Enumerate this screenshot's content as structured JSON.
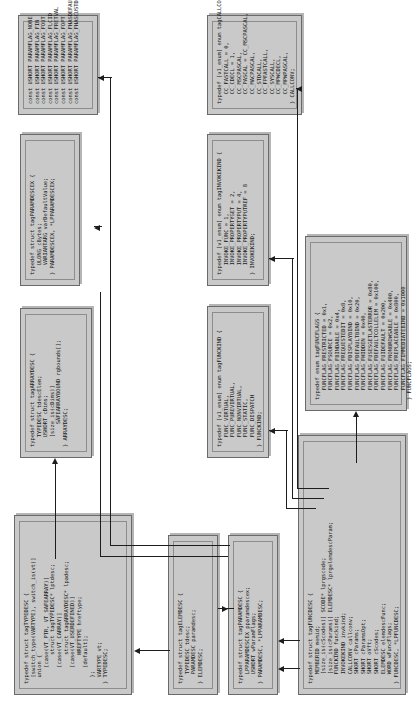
{
  "diagram": {
    "box_fill": "#c9c9c9",
    "box_border": "#6a6a6a",
    "line_color": "#1d1d1d"
  },
  "boxes": {
    "typedesc": {
      "name": "TYPEDESC",
      "code": "typedef struct tagTYPEDESC {\n  [switch_type(VARTYPE), switch_is(vt)]\n  union {\n     [case(VT_PTR, VT_SAFEARRAY)]\n         struct tagTYPEDESC* lptdesc;\n     [case(VT_CARRAY)]\n         struct tagARRAYDESC* lpadesc;\n     [case(VT_USERDEFINED)]\n         HREFTYPE hreftype;\n     [default];\n  };\n  VARTYPE vt;\n} TYPEDESC;"
    },
    "arraydesc": {
      "name": "ARRAYDESC",
      "code": "typedef struct tagARRAYDESC {\n   TYPEDESC tdescElem;\n   USHORT cDims;\n   [size_is(cDims)]\n       SAFEARRAYBOUND rgbounds[];\n} ARRAYDESC;"
    },
    "paramdescex": {
      "name": "PARAMDESCEX",
      "code": "typedef struct tagPARAMDESCEX {\n   ULONG cBytes;\n   VARIANTARG varDefaultValue;\n} PARAMDESCEX, *LPPARAMDESCEX;"
    },
    "paramflags": {
      "name": "PARAMFLAG constants",
      "code": "const USHORT PARAMFLAG_NONE          = 0x00;\nconst USHORT PARAMFLAG_FIN           = 0x01;\nconst USHORT PARAMFLAG_FOUT          = 0x02;\nconst USHORT PARAMFLAG_FLCID         = 0x04;\nconst USHORT PARAMFLAG_FRETVAL       = 0x08;\nconst USHORT PARAMFLAG_FOPT          = 0x10;\nconst USHORT PARAMFLAG_FHASDEFAULT   = 0x20;\nconst USHORT PARAMFLAG_FHASCUSTDATA  = 0x40;"
    },
    "elemdesc": {
      "name": "ELEMDESC",
      "code": "typedef struct tagELEMDESC {\n   TYPEDESC tdesc;\n   PARAMDESC paramdesc;\n} ELEMDESC;"
    },
    "paramdesc": {
      "name": "PARAMDESC",
      "code": "typedef struct tagPARAMDESC {\n   LPPARAMDESCEX pparamdescex;\n   USHORT wParamFlags;\n} PARAMDESC, *LPPARAMDESC;"
    },
    "funckind": {
      "name": "FUNCKIND",
      "code": "typedef [v1_enum] enum tagFUNCKIND {\n   FUNC_VIRTUAL,\n   FUNC_PUREVIRTUAL,\n   FUNC_NONVIRTUAL,\n   FUNC_STATIC,\n   FUNC_DISPATCH\n} FUNCKIND;"
    },
    "invokekind": {
      "name": "INVOKEKIND",
      "code": "typedef [v1_enum] enum tagINVOKEKIND {\n   INVOKE_FUNC = 1,\n   INVOKE_PROPERTYGET = 2,\n   INVOKE_PROPERTYPUT = 4,\n   INVOKE_PROPERTYPUTREF = 8\n} INVOKEKIND;"
    },
    "callconv": {
      "name": "CALLCONV",
      "code": "typedef [v1_enum] enum tagCALLCONV {\n   CC_FASTCALL = 0,\n   CC_CDECL = 1,\n   CC_MSCPASCAL,\n   CC_PASCAL = CC_MSCPASCAL,\n   CC_MACPASCAL,\n   CC_STDCALL,\n   CC_FPFASTCALL,\n   CC_SYSCALL,\n   CC_MPWCDECL,\n   CC_MPWPASCAL,\n} CALLCONV;"
    },
    "funcdesc": {
      "name": "FUNCDESC",
      "code": "typedef struct tagFUNCDESC {\n   MEMBERID memid;\n   [size_is(cScodes)] SCODE* lprgscode;\n   [size_is(cParams)] ELEMDESC* lprgelemdescParam;\n   FUNCKIND funckind;\n   INVOKEKIND invkind;\n   CALLCONV callconv;\n   SHORT cParams;\n   SHORT cParamsOpt;\n   SHORT oVft;\n   SHORT cScodes;\n   ELEMDESC elemdescFunc;\n   WORD wFuncFlags;\n} FUNCDESC, *LPFUNCDESC;"
    },
    "funcflags": {
      "name": "FUNCFLAGS",
      "code": "typedef enum tagFUNCFLAGS {\n   FUNCFLAG_FRESTRICTED = 0x1,\n   FUNCFLAG_FSOURCE = 0x2,\n   FUNCFLAG_FBINDABLE = 0x4,\n   FUNCFLAG_FREQUESTEDIT = 0x8,\n   FUNCFLAG_FDISPLAYBIND = 0x10,\n   FUNCFLAG_FDEFAULTBIND = 0x20,\n   FUNCFLAG_FHIDDEN = 0x40,\n   FUNCFLAG_FUSESGETLASTERROR = 0x80,\n   FUNCFLAG_FDEFAULTCOLLELEM = 0x100,\n   FUNCFLAG_FUIDEFAULT = 0x200,\n   FUNCFLAG_FNONBROWSABLE = 0x400,\n   FUNCFLAG_FREPLACEABLE = 0x800,\n   FUNCFLAG_FIMMEDIATEBIND = 0x1000\n} FUNCFLAGS;"
    }
  }
}
